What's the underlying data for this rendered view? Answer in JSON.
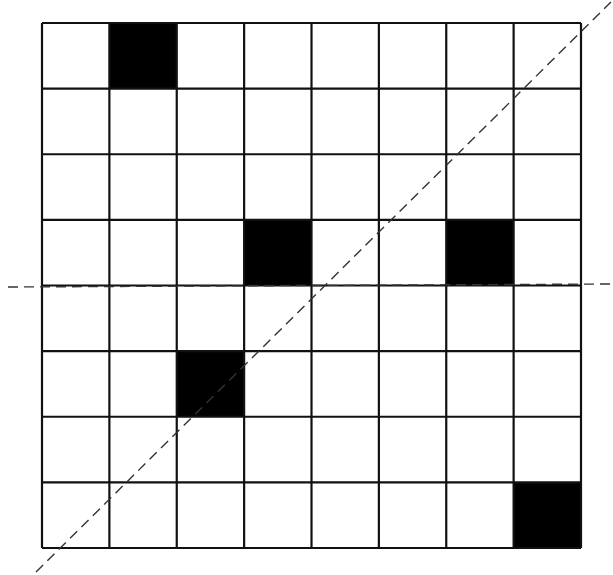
{
  "diagram": {
    "type": "grid-symmetry",
    "rows": 8,
    "cols": 8,
    "colors": {
      "background": "#ffffff",
      "line": "#111111",
      "filled": "#000000",
      "dashed": "#333333"
    },
    "grid_bounds": {
      "x0": 42,
      "y0": 23,
      "x1": 581,
      "y1": 548
    },
    "filled_cells": [
      {
        "row": 0,
        "col": 1
      },
      {
        "row": 3,
        "col": 3
      },
      {
        "row": 3,
        "col": 6
      },
      {
        "row": 5,
        "col": 2
      },
      {
        "row": 7,
        "col": 7
      }
    ],
    "dashed_lines": [
      {
        "name": "diagonal-axis",
        "x1": 36,
        "y1": 572,
        "x2": 611,
        "y2": 2
      },
      {
        "name": "horizontal-axis",
        "x1": 8,
        "y1": 287,
        "x2": 612,
        "y2": 284
      }
    ]
  }
}
